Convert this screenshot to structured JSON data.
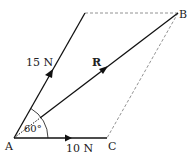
{
  "diagram": {
    "type": "parallelogram-of-forces",
    "points": {
      "A": {
        "label": "A",
        "x": 14,
        "y": 138
      },
      "B": {
        "label": "B",
        "x": 178,
        "y": 13
      },
      "C": {
        "label": "C",
        "x": 107,
        "y": 138
      },
      "D": {
        "x": 85,
        "y": 13
      }
    },
    "forces": [
      {
        "name": "15 N",
        "label": "15 N",
        "from": "A",
        "to": "D"
      },
      {
        "name": "10 N",
        "label": "10 N",
        "from": "A",
        "to": "C"
      },
      {
        "name": "R",
        "label": "R",
        "from": "A",
        "to": "B"
      }
    ],
    "angle": {
      "label": "60°",
      "vertex": "A"
    },
    "colors": {
      "line": "#111111",
      "dashed": "#777777"
    }
  }
}
